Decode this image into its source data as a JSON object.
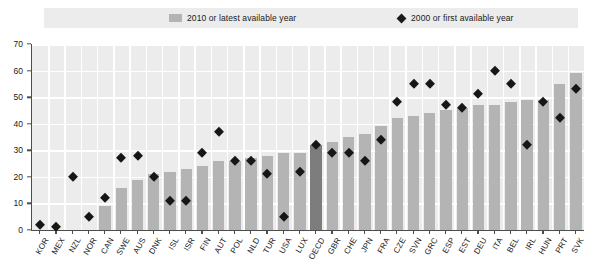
{
  "legend": {
    "bars_label": "2010 or latest available year",
    "diamonds_label": "2000 or first available year",
    "bar_swatch_icon": "bar-swatch",
    "diamond_swatch_icon": "diamond-swatch"
  },
  "axis": {
    "y_ticks": [
      "0",
      "10",
      "20",
      "30",
      "40",
      "50",
      "60",
      "70"
    ]
  },
  "colors": {
    "bar": "#b4b4b4",
    "bar_highlight": "#7d7d7d",
    "marker": "#161616",
    "plot_background": "#ececec",
    "gridline": "#ffffff",
    "axis": "#4d4d4d"
  },
  "chart_data": {
    "type": "bar",
    "title": "",
    "subtitle": "",
    "xlabel": "",
    "ylabel": "",
    "ylim": [
      0,
      70
    ],
    "ytick_step": 10,
    "grid": true,
    "legend_position": "top",
    "highlight_category": "OECD",
    "categories": [
      "KOR",
      "MEX",
      "NZL",
      "NOR",
      "CAN",
      "SWE",
      "AUS",
      "DNK",
      "ISL",
      "ISR",
      "FIN",
      "AUT",
      "POL",
      "NLD",
      "TUR",
      "USA",
      "LUX",
      "OECD",
      "GBR",
      "CHE",
      "JPN",
      "FRA",
      "CZE",
      "SVN",
      "GRC",
      "ESP",
      "EST",
      "DEU",
      "ITA",
      "BEL",
      "IRL",
      "HUN",
      "PRT",
      "SVK"
    ],
    "series": [
      {
        "name": "2010 or latest available year",
        "type": "bar",
        "values": [
          0,
          0,
          0,
          0,
          9,
          16,
          19,
          21,
          22,
          23,
          24,
          26,
          26,
          27,
          28,
          29,
          29,
          32,
          33,
          35,
          36,
          39,
          42,
          43,
          44,
          45,
          46,
          47,
          47,
          48,
          49,
          49,
          55,
          59
        ]
      },
      {
        "name": "2000 or first available year",
        "type": "scatter",
        "values": [
          2,
          1,
          20,
          5,
          12,
          27,
          28,
          20,
          11,
          11,
          29,
          37,
          26,
          26,
          21,
          5,
          22,
          32,
          29,
          29,
          26,
          34,
          48,
          55,
          55,
          47,
          46,
          51,
          60,
          55,
          32,
          48,
          42,
          53
        ]
      }
    ]
  }
}
